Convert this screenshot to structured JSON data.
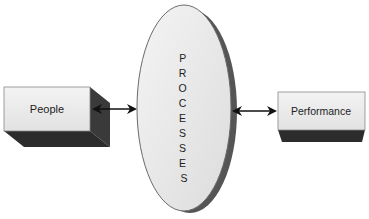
{
  "diagram": {
    "nodes": [
      {
        "id": "people",
        "label": "People",
        "shape": "3d-box"
      },
      {
        "id": "processes",
        "label": "PROCESSES",
        "letters": [
          "P",
          "R",
          "O",
          "C",
          "E",
          "S",
          "S",
          "E",
          "S"
        ],
        "shape": "3d-ellipse"
      },
      {
        "id": "performance",
        "label": "Performance",
        "shape": "3d-box"
      }
    ],
    "edges": [
      {
        "from": "people",
        "to": "processes",
        "type": "bidirectional-arrow"
      },
      {
        "from": "processes",
        "to": "performance",
        "type": "bidirectional-arrow"
      }
    ],
    "colors": {
      "face": "#ececec",
      "side": "#3a3a3a",
      "ellipse_face": "#e6e6e6",
      "ellipse_edge": "#6a6a6a",
      "text": "#222222"
    }
  }
}
